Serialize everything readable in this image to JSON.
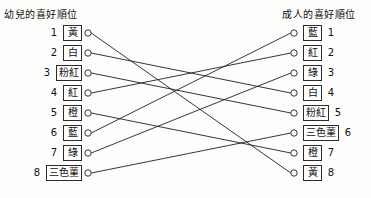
{
  "headers": {
    "left_title": "幼兒的喜好順位",
    "right_title": "成人的喜好順位"
  },
  "left_column": {
    "items": [
      {
        "rank": "1",
        "color": "黃"
      },
      {
        "rank": "2",
        "color": "白"
      },
      {
        "rank": "3",
        "color": "粉紅"
      },
      {
        "rank": "4",
        "color": "紅"
      },
      {
        "rank": "5",
        "color": "橙"
      },
      {
        "rank": "6",
        "color": "藍"
      },
      {
        "rank": "7",
        "color": "綠"
      },
      {
        "rank": "8",
        "color": "三色菫"
      }
    ]
  },
  "right_column": {
    "items": [
      {
        "rank": "1",
        "color": "藍"
      },
      {
        "rank": "2",
        "color": "紅"
      },
      {
        "rank": "3",
        "color": "綠"
      },
      {
        "rank": "4",
        "color": "白"
      },
      {
        "rank": "5",
        "color": "粉紅"
      },
      {
        "rank": "6",
        "color": "三色菫"
      },
      {
        "rank": "7",
        "color": "橙"
      },
      {
        "rank": "8",
        "color": "黃"
      }
    ]
  },
  "connections": [
    {
      "color": "黃",
      "left_rank": 1,
      "right_rank": 8
    },
    {
      "color": "白",
      "left_rank": 2,
      "right_rank": 4
    },
    {
      "color": "粉紅",
      "left_rank": 3,
      "right_rank": 5
    },
    {
      "color": "紅",
      "left_rank": 4,
      "right_rank": 2
    },
    {
      "color": "橙",
      "left_rank": 5,
      "right_rank": 7
    },
    {
      "color": "藍",
      "left_rank": 6,
      "right_rank": 1
    },
    {
      "color": "綠",
      "left_rank": 7,
      "right_rank": 3
    },
    {
      "color": "三色菫",
      "left_rank": 8,
      "right_rank": 6
    }
  ],
  "geometry": {
    "left_node_x": 88,
    "right_node_x": 294,
    "first_row_y": 33,
    "row_spacing": 20,
    "node_radius": 3.2
  },
  "colors": {
    "line": "#202020",
    "box_border": "#2a2a2a",
    "background": "#fdfdfb"
  }
}
